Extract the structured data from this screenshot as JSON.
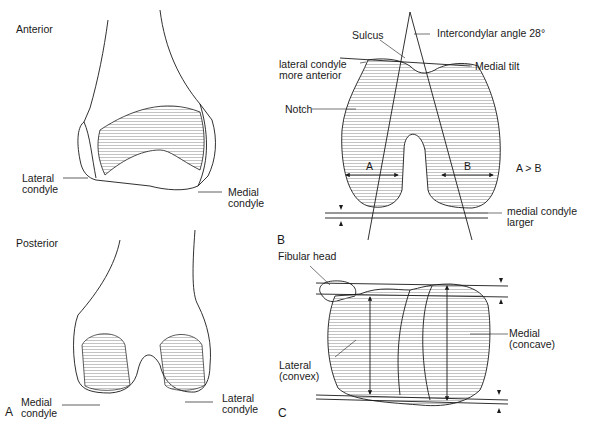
{
  "panel_a": {
    "letter": "A",
    "anterior_view": {
      "title": "Anterior",
      "labels": {
        "lateral_condyle_1": "Lateral",
        "lateral_condyle_2": "condyle",
        "medial_condyle_1": "Medial",
        "medial_condyle_2": "condyle"
      }
    },
    "posterior_view": {
      "title": "Posterior",
      "labels": {
        "medial_condyle_1": "Medial",
        "medial_condyle_2": "condyle",
        "lateral_condyle_1": "Lateral",
        "lateral_condyle_2": "condyle"
      }
    }
  },
  "panel_b": {
    "letter": "B",
    "labels": {
      "sulcus": "Sulcus",
      "intercondylar_angle": "Intercondylar angle  28°",
      "lateral_anterior_1": "lateral condyle",
      "lateral_anterior_2": "more anterior",
      "medial_tilt": "Medial tilt",
      "notch": "Notch",
      "width_a": "A",
      "width_b": "B",
      "comparison": "A > B",
      "medial_larger_1": "medial condyle",
      "medial_larger_2": "larger"
    }
  },
  "panel_c": {
    "letter": "C",
    "labels": {
      "fibular_head": "Fibular head",
      "medial_1": "Medial",
      "medial_2": "(concave)",
      "lateral_1": "Lateral",
      "lateral_2": "(convex)"
    }
  },
  "colors": {
    "ink": "#1a1a1a",
    "background": "#ffffff",
    "shading": "#bdbdbd"
  }
}
